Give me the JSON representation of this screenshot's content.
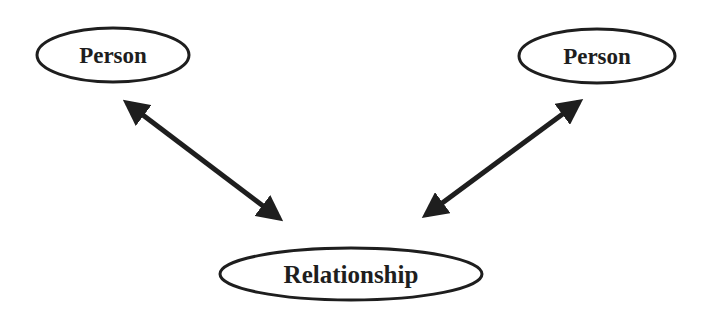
{
  "diagram": {
    "nodes": [
      {
        "id": "person_left",
        "label": "Person",
        "cx": 113,
        "cy": 55,
        "rx": 77,
        "ry": 28
      },
      {
        "id": "person_right",
        "label": "Person",
        "cx": 597,
        "cy": 56,
        "rx": 79,
        "ry": 28
      },
      {
        "id": "relationship",
        "label": "Relationship",
        "cx": 351,
        "cy": 274,
        "rx": 132,
        "ry": 27
      }
    ],
    "edges": [
      {
        "from": "person_left",
        "to": "relationship",
        "type": "bidirectional-arrow"
      },
      {
        "from": "relationship",
        "to": "person_right",
        "type": "bidirectional-arrow"
      }
    ],
    "colors": {
      "stroke": "#1e1e1e",
      "background": "#ffffff"
    }
  }
}
